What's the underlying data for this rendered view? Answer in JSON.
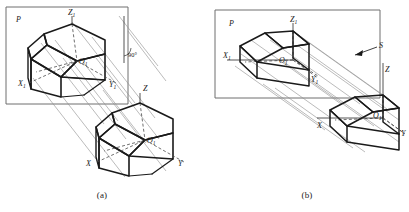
{
  "figure": {
    "type": "technical-drawing",
    "background_color": "#ffffff",
    "ink_color": "#1a1a1a",
    "projector_color": "#8d8d8d",
    "plane_outline_color": "#6f6f6f"
  },
  "panels": [
    {
      "id": "a",
      "caption": "(a)",
      "plane_label": "P",
      "projection_kind": "orthographic",
      "angle_annotation": "90°",
      "labels": {
        "projected_axes": {
          "z": "Z₁",
          "x": "X₁",
          "y": "Y₁",
          "origin": "O₁"
        },
        "object_axes": {
          "z": "Z",
          "x": "X",
          "y": "Y",
          "origin": "O₁"
        }
      },
      "label_list": [
        "P",
        "Z₁",
        "X₁",
        "Y₁",
        "O₁",
        "90°",
        "Z",
        "X",
        "Y",
        "O₁"
      ]
    },
    {
      "id": "b",
      "caption": "(b)",
      "plane_label": "P",
      "projection_kind": "oblique",
      "direction_label": "S",
      "labels": {
        "projected_axes": {
          "z": "Z₁",
          "x": "X₁",
          "y": "Y₁",
          "origin": "O₁"
        },
        "object_axes": {
          "z": "Z",
          "x": "X",
          "y": "Y",
          "origin": "O₁"
        }
      },
      "label_list": [
        "P",
        "Z₁",
        "X₁",
        "Y₁",
        "O₁",
        "S",
        "Z",
        "X",
        "Y",
        "O₁"
      ]
    }
  ],
  "panel_a": {
    "plane_label": "P",
    "caption": "(a)",
    "angle": "90°",
    "z1": "Z₁",
    "x1": "X₁",
    "y1": "Y₁",
    "o1": "O₁",
    "z": "Z",
    "x": "X",
    "y": "Y",
    "o": "O₁"
  },
  "panel_b": {
    "plane_label": "P",
    "caption": "(b)",
    "direction": "S",
    "z1": "Z₁",
    "x1": "X₁",
    "y1": "Y₁",
    "o1": "O₁",
    "z": "Z",
    "x": "X",
    "y": "Y",
    "o": "O₁"
  }
}
